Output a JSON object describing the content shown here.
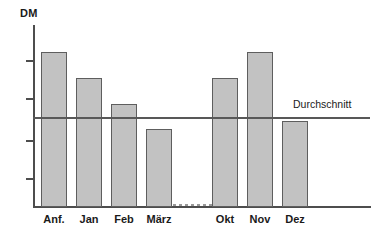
{
  "chart_data": {
    "type": "bar",
    "title": "",
    "subtitle": "",
    "ylabel": "DM",
    "xlabel": "",
    "categories": [
      "Anf.",
      "Jan",
      "Feb",
      "März",
      "Okt",
      "Nov",
      "Dez"
    ],
    "values": [
      8.4,
      6.9,
      5.4,
      4.0,
      6.9,
      8.4,
      4.5
    ],
    "ylim": [
      0,
      10
    ],
    "grid": false,
    "legend": null,
    "annotations": [
      {
        "name": "average-line",
        "label": "Durchschnitt",
        "value": 5.0,
        "orientation": "horizontal"
      },
      {
        "name": "series-break",
        "label": "",
        "style": "dashed-baseline-gap",
        "between": [
          "März",
          "Okt"
        ]
      }
    ],
    "y_ticks": [
      2.0,
      4.0,
      6.0,
      8.0
    ],
    "y_tick_labels": [
      "",
      "",
      "",
      ""
    ],
    "bar_fill_color": "#c2c2c2",
    "bar_border_color": "#5e5e5e",
    "axis_color": "#4d4d4d",
    "average_line_color": "#585858",
    "background_color": "#ffffff"
  },
  "axis": {
    "y_unit_label": "DM"
  },
  "average": {
    "label": "Durchschnitt"
  },
  "bars": [
    {
      "label": "Anf.",
      "left": 41,
      "top": 52,
      "width": 26,
      "height": 155,
      "label_left": 41,
      "label_width": 26
    },
    {
      "label": "Jan",
      "left": 76,
      "top": 78,
      "width": 26,
      "height": 129,
      "label_left": 76,
      "label_width": 26
    },
    {
      "label": "Feb",
      "left": 111,
      "top": 104,
      "width": 26,
      "height": 103,
      "label_left": 111,
      "label_width": 26
    },
    {
      "label": "März",
      "left": 146,
      "top": 129,
      "width": 26,
      "height": 78,
      "label_left": 143,
      "label_width": 32
    },
    {
      "label": "Okt",
      "left": 212,
      "top": 78,
      "width": 26,
      "height": 129,
      "label_left": 212,
      "label_width": 26
    },
    {
      "label": "Nov",
      "left": 247,
      "top": 52,
      "width": 26,
      "height": 155,
      "label_left": 246,
      "label_width": 28
    },
    {
      "label": "Dez",
      "left": 282,
      "top": 121,
      "width": 26,
      "height": 86,
      "label_left": 282,
      "label_width": 26
    }
  ],
  "y_ticks": [
    {
      "top": 60
    },
    {
      "top": 98
    },
    {
      "top": 140
    },
    {
      "top": 178
    }
  ]
}
